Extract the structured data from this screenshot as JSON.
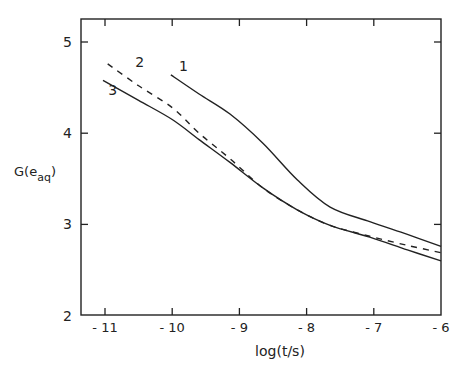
{
  "chart_data": {
    "type": "line",
    "title": "",
    "xlabel": "log(t/s)",
    "ylabel": "G(e⁻_aq)",
    "ylabel_parts": {
      "base": "G(e",
      "sup": "–",
      "sub": "aq",
      "close": ")"
    },
    "xlim": [
      -11.35,
      -6
    ],
    "ylim": [
      2,
      5.25
    ],
    "xticks": [
      -11,
      -10,
      -9,
      -8,
      -7,
      -6
    ],
    "xtick_labels": [
      "- 11",
      "- 10",
      "- 9",
      "- 8",
      "- 7",
      "- 6"
    ],
    "yticks": [
      2,
      3,
      4,
      5
    ],
    "ytick_labels": [
      "2",
      "3",
      "4",
      "5"
    ],
    "grid": false,
    "legend": "none (curves labelled inline 1, 2, 3)",
    "series": [
      {
        "name": "1",
        "style": "solid",
        "x": [
          -10.02,
          -9.6,
          -9.14,
          -8.65,
          -8.14,
          -7.65,
          -7.06,
          -6.5,
          -6.0
        ],
        "y": [
          4.64,
          4.43,
          4.21,
          3.89,
          3.49,
          3.19,
          3.03,
          2.89,
          2.76
        ]
      },
      {
        "name": "2",
        "style": "dashed",
        "x": [
          -10.96,
          -10.5,
          -10.0,
          -9.6,
          -9.14,
          -8.65,
          -8.14,
          -7.65,
          -7.06,
          -6.5,
          -6.0
        ],
        "y": [
          4.76,
          4.52,
          4.28,
          4.0,
          3.72,
          3.4,
          3.16,
          2.99,
          2.87,
          2.77,
          2.69
        ]
      },
      {
        "name": "3",
        "style": "solid",
        "x": [
          -11.03,
          -10.5,
          -10.0,
          -9.6,
          -9.14,
          -8.65,
          -8.14,
          -7.65,
          -7.06,
          -6.5,
          -6.0
        ],
        "y": [
          4.58,
          4.36,
          4.15,
          3.93,
          3.68,
          3.4,
          3.16,
          2.99,
          2.86,
          2.72,
          2.6
        ]
      }
    ],
    "annotations": [
      {
        "text": "1",
        "x": -9.9,
        "y": 4.68
      },
      {
        "text": "2",
        "x": -10.55,
        "y": 4.73
      },
      {
        "text": "3",
        "x": -10.95,
        "y": 4.42
      }
    ]
  }
}
